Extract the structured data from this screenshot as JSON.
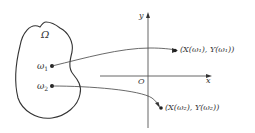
{
  "diagram": {
    "type": "mapping",
    "colors": {
      "stroke": "#333333",
      "background": "#ffffff"
    },
    "region": {
      "label": "Ω",
      "shape": "closed-blob"
    },
    "points": [
      {
        "id": "w1",
        "label": "ω",
        "subscript": "1",
        "image_label": "(X(ω₁), Y(ω₁))"
      },
      {
        "id": "w2",
        "label": "ω",
        "subscript": "2",
        "image_label": "(X(ω₂), Y(ω₂))"
      }
    ],
    "axes": {
      "x_label": "x",
      "y_label": "y",
      "origin_label": "O"
    }
  }
}
